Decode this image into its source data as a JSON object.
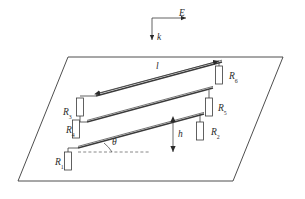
{
  "figure": {
    "background_color": "#ffffff",
    "line_color": "#3a3a3a",
    "label_color": "#2b2b2b"
  },
  "vectors": {
    "e_field": {
      "symbol": "E",
      "direction": "right"
    },
    "wave_vector": {
      "symbol": "k",
      "direction": "down"
    }
  },
  "dimensions": {
    "length": {
      "symbol": "l",
      "description": "rail length, double headed arrow along top rail"
    },
    "height": {
      "symbol": "h",
      "description": "vertical height, double headed arrow"
    },
    "angle": {
      "symbol": "θ",
      "description": "inclination angle from horizontal dashed line"
    }
  },
  "resistors": [
    {
      "id": "R1",
      "symbol": "R",
      "subscript": "1",
      "label_side": "left",
      "label_x": 55,
      "label_y": 158
    },
    {
      "id": "R4",
      "symbol": "R",
      "subscript": "4",
      "label_side": "left",
      "label_x": 66,
      "label_y": 126
    },
    {
      "id": "R3",
      "symbol": "R",
      "subscript": "3",
      "label_side": "left",
      "label_x": 63,
      "label_y": 108
    },
    {
      "id": "R2",
      "symbol": "R",
      "subscript": "2",
      "label_side": "right",
      "label_x": 211,
      "label_y": 128
    },
    {
      "id": "R5",
      "symbol": "R",
      "subscript": "5",
      "label_side": "right",
      "label_x": 218,
      "label_y": 104
    },
    {
      "id": "R6",
      "symbol": "R",
      "subscript": "6",
      "label_side": "right",
      "label_x": 229,
      "label_y": 72
    }
  ],
  "plane": {
    "shape": "parallelogram",
    "vertices": "68,57 283,57 233,181 18,181"
  },
  "rails": [
    {
      "name": "top-rail",
      "from": "96,96",
      "to": "222,62"
    },
    {
      "name": "middle-rail",
      "from": "87,122",
      "to": "213,88"
    },
    {
      "name": "bottom-rail",
      "from": "78,148",
      "to": "204,114"
    }
  ]
}
